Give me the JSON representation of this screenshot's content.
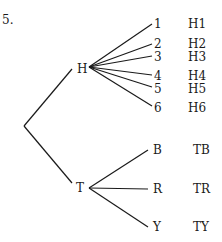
{
  "problem": {
    "number": "5."
  },
  "tree": {
    "root": {
      "x": 24,
      "y": 126
    },
    "nodes": [
      {
        "label": "H",
        "x": 82,
        "y": 69,
        "branch_from": {
          "x": 89,
          "y": 67
        },
        "children": [
          {
            "label": "1",
            "outcome": "H1",
            "end": {
              "x": 152,
              "y": 24
            }
          },
          {
            "label": "2",
            "outcome": "H2",
            "end": {
              "x": 152,
              "y": 44
            }
          },
          {
            "label": "3",
            "outcome": "H3",
            "end": {
              "x": 152,
              "y": 56
            }
          },
          {
            "label": "4",
            "outcome": "H4",
            "end": {
              "x": 152,
              "y": 75
            }
          },
          {
            "label": "5",
            "outcome": "H5",
            "end": {
              "x": 152,
              "y": 87
            }
          },
          {
            "label": "6",
            "outcome": "H6",
            "end": {
              "x": 152,
              "y": 106
            }
          }
        ]
      },
      {
        "label": "T",
        "x": 81,
        "y": 188,
        "branch_from": {
          "x": 89,
          "y": 188
        },
        "children": [
          {
            "label": "B",
            "outcome": "TB",
            "end": {
              "x": 148,
              "y": 150
            }
          },
          {
            "label": "R",
            "outcome": "TR",
            "end": {
              "x": 148,
              "y": 189
            }
          },
          {
            "label": "Y",
            "outcome": "TY",
            "end": {
              "x": 148,
              "y": 227
            }
          }
        ]
      }
    ]
  },
  "style": {
    "line_color": "#1a1a1a",
    "text_color": "#1a1a1a"
  }
}
